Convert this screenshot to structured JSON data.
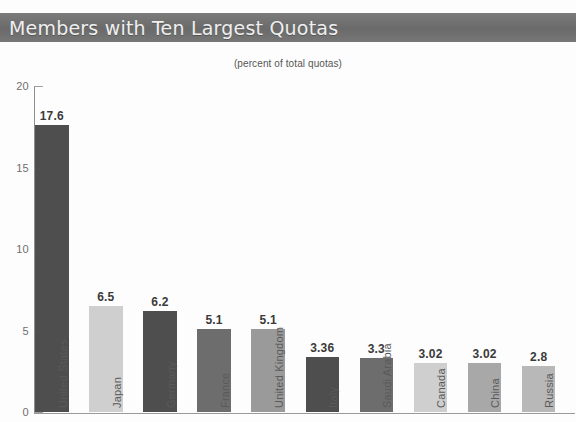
{
  "header": {
    "title": "Members with Ten Largest Quotas"
  },
  "chart_data": {
    "type": "bar",
    "title": "Members with Ten Largest Quotas",
    "subtitle": "(percent of total quotas)",
    "xlabel": "",
    "ylabel": "",
    "ylim": [
      0,
      20
    ],
    "yticks": [
      0,
      5,
      10,
      15,
      20
    ],
    "ytick_labels": [
      "0",
      "5",
      "10",
      "15",
      "20"
    ],
    "grid": false,
    "legend": "none",
    "categories": [
      "United States",
      "Japan",
      "Germany",
      "France",
      "United Kingdom",
      "Italy",
      "Saudi Arabia",
      "Canada",
      "China",
      "Russia"
    ],
    "values": [
      17.6,
      6.5,
      6.2,
      5.1,
      5.1,
      3.36,
      3.3,
      3.02,
      3.02,
      2.8
    ],
    "value_labels": [
      "17.6",
      "6.5",
      "6.2",
      "5.1",
      "5.1",
      "3.36",
      "3.3",
      "3.02",
      "3.02",
      "2.8"
    ],
    "bar_colors": [
      "#4e4e4e",
      "#cfcfcf",
      "#4e4e4e",
      "#6d6d6d",
      "#9a9a9a",
      "#4e4e4e",
      "#6d6d6d",
      "#cfcfcf",
      "#a8a8a8",
      "#b8b8b8"
    ],
    "colors": {
      "banner": "#6f6f6f",
      "banner_text": "#efefef",
      "axis": "#8e8e8e",
      "tick_text": "#6e6e6e",
      "value_text": "#3a3a3a",
      "background": "#fdfdfd"
    }
  }
}
